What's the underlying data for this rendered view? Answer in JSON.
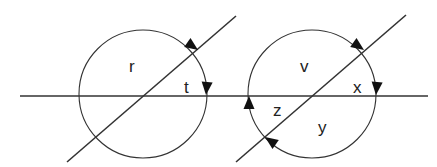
{
  "figure": {
    "horizontal_line": {
      "x1": 20,
      "y1": 96,
      "x2": 428,
      "y2": 96
    },
    "left": {
      "circle": {
        "cx": 143,
        "cy": 94,
        "r": 64
      },
      "diagonal": {
        "x1": 67,
        "y1": 162,
        "x2": 236,
        "y2": 16
      },
      "labels": [
        {
          "id": "r",
          "text": "r",
          "x": 129,
          "y": 72
        },
        {
          "id": "t",
          "text": "t",
          "x": 184,
          "y": 93
        }
      ],
      "arrows": [
        {
          "name": "arrow-at-diagonal-intersection",
          "tip_x": 198,
          "tip_y": 50,
          "angle": 35
        },
        {
          "name": "arrow-at-horizontal-intersection",
          "tip_x": 206,
          "tip_y": 95,
          "angle": 95
        }
      ]
    },
    "right": {
      "circle": {
        "cx": 312,
        "cy": 94,
        "r": 64
      },
      "diagonal": {
        "x1": 236,
        "y1": 162,
        "x2": 406,
        "y2": 15
      },
      "labels": [
        {
          "id": "v",
          "text": "v",
          "x": 300,
          "y": 72
        },
        {
          "id": "x",
          "text": "x",
          "x": 353,
          "y": 93
        },
        {
          "id": "z",
          "text": "z",
          "x": 273,
          "y": 116
        },
        {
          "id": "y",
          "text": "y",
          "x": 318,
          "y": 133
        }
      ],
      "arrows": [
        {
          "name": "arrow-at-upper-diagonal-intersection",
          "tip_x": 364,
          "tip_y": 50,
          "angle": 35
        },
        {
          "name": "arrow-at-right-horizontal-intersection",
          "tip_x": 376,
          "tip_y": 95,
          "angle": 95
        },
        {
          "name": "arrow-at-left-horizontal-intersection",
          "tip_x": 249,
          "tip_y": 96,
          "angle": -90
        },
        {
          "name": "arrow-at-lower-diagonal-intersection",
          "tip_x": 265,
          "tip_y": 137,
          "angle": 215
        }
      ]
    }
  }
}
